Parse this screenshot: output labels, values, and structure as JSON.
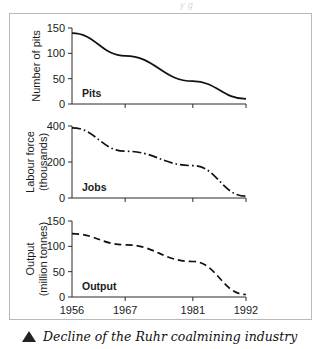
{
  "figure": {
    "top_bleed_text": "y    g",
    "caption": {
      "marker": "triangle-up",
      "text": "Decline of the Ruhr coalmining industry"
    }
  },
  "chart_data": {
    "type": "line",
    "title": "Decline of the Ruhr coalmining industry",
    "xlabel": "",
    "x": [
      1956,
      1967,
      1981,
      1992
    ],
    "xlim": [
      1956,
      1992
    ],
    "xtick_labels": [
      "1956",
      "1967",
      "1981",
      "1992"
    ],
    "grid": false,
    "legend": "none",
    "panels": [
      {
        "name": "Pits",
        "ylabel": "Number of pits",
        "series_label": "Pits",
        "linestyle": "solid",
        "ylim": [
          0,
          150
        ],
        "yticks": [
          0,
          50,
          100,
          150
        ],
        "ytick_labels": [
          "0",
          "50",
          "100",
          "150"
        ],
        "values": [
          140,
          95,
          45,
          10
        ]
      },
      {
        "name": "Jobs",
        "ylabel": "Labour force (thousands)",
        "ylabel_line1": "Labour force",
        "ylabel_line2": "(thousands)",
        "series_label": "Jobs",
        "linestyle": "dashdot",
        "ylim": [
          0,
          400
        ],
        "yticks": [
          0,
          200,
          400
        ],
        "ytick_labels": [
          "0",
          "200",
          "400"
        ],
        "values": [
          390,
          260,
          180,
          10
        ]
      },
      {
        "name": "Output",
        "ylabel": "Output (million tonnes)",
        "ylabel_line1": "Output",
        "ylabel_line2": "(million tonnes)",
        "series_label": "Output",
        "linestyle": "dashed",
        "ylim": [
          0,
          150
        ],
        "yticks": [
          0,
          50,
          100,
          150
        ],
        "ytick_labels": [
          "0",
          "50",
          "100",
          "150"
        ],
        "values": [
          125,
          103,
          70,
          5
        ]
      }
    ]
  }
}
